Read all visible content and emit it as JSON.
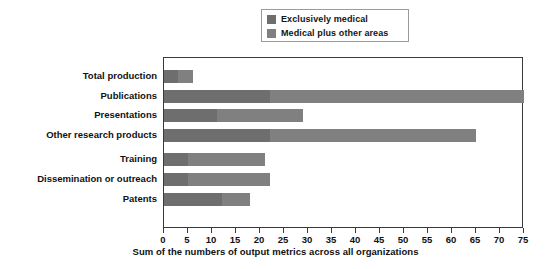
{
  "chart_data": {
    "type": "bar",
    "orientation": "horizontal",
    "stacked": true,
    "title": "",
    "xlabel": "Sum of the numbers of output metrics across all organizations",
    "ylabel": "",
    "xlim": [
      0,
      75
    ],
    "xticks": [
      0,
      5,
      10,
      15,
      20,
      25,
      30,
      35,
      40,
      45,
      50,
      55,
      60,
      65,
      70,
      75
    ],
    "grid": false,
    "legend_position": "top-center",
    "categories": [
      "Total production",
      "Publications",
      "Presentations",
      "Other research products",
      "Training",
      "Dissemination or outreach",
      "Patents"
    ],
    "series": [
      {
        "name": "Exclusively medical",
        "color": "#6e6e6e",
        "values": [
          3,
          22,
          11,
          22,
          5,
          5,
          12
        ]
      },
      {
        "name": "Medical plus other areas",
        "color": "#808080",
        "values": [
          3,
          53,
          18,
          43,
          16,
          17,
          6
        ]
      }
    ],
    "totals": [
      6,
      75,
      29,
      65,
      21,
      22,
      18
    ]
  },
  "legend": {
    "items": [
      {
        "label": "Exclusively medical",
        "color": "#6e6e6e"
      },
      {
        "label": "Medical plus other areas",
        "color": "#808080"
      }
    ]
  },
  "axis": {
    "x_title": "Sum of the numbers of output metrics across all organizations",
    "tick_labels": [
      "0",
      "5",
      "10",
      "15",
      "20",
      "25",
      "30",
      "35",
      "40",
      "45",
      "50",
      "55",
      "60",
      "65",
      "70",
      "75"
    ]
  },
  "colors": {
    "series_1": "#6e6e6e",
    "series_2": "#808080",
    "frame": "#3a3a3a",
    "text": "#111111",
    "background": "#ffffff"
  }
}
